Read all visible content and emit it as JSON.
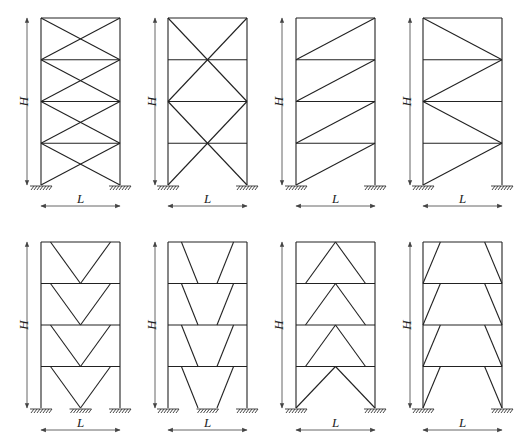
{
  "figure": {
    "labels": {
      "height": "H",
      "width": "L"
    },
    "stories": 4,
    "colors": {
      "line": "#222222",
      "dimension": "#555555",
      "background": "#ffffff"
    },
    "rows": [
      {
        "name": "top-row",
        "frame_top": 18,
        "frame_bottom": 185,
        "dim_y": 206,
        "panels": [
          {
            "id": "x-bracing-each-story",
            "x_left": 41,
            "x_right": 120,
            "h_arrow_x": 27,
            "type": "X"
          },
          {
            "id": "x-bracing-two-story",
            "x_left": 168,
            "x_right": 247,
            "h_arrow_x": 155,
            "type": "X2"
          },
          {
            "id": "single-diagonal-same-direction",
            "x_left": 296,
            "x_right": 375,
            "h_arrow_x": 282,
            "type": "D"
          },
          {
            "id": "single-diagonal-alternating",
            "x_left": 423,
            "x_right": 502,
            "h_arrow_x": 410,
            "type": "Z"
          }
        ]
      },
      {
        "name": "bottom-row",
        "frame_top": 242,
        "frame_bottom": 408,
        "dim_y": 430,
        "panels": [
          {
            "id": "v-bracing",
            "x_left": 41,
            "x_right": 120,
            "h_arrow_x": 27,
            "type": "V"
          },
          {
            "id": "v-bracing-eccentric",
            "x_left": 168,
            "x_right": 247,
            "h_arrow_x": 155,
            "type": "VE"
          },
          {
            "id": "inverted-v-chevron",
            "x_left": 296,
            "x_right": 375,
            "h_arrow_x": 282,
            "type": "A"
          },
          {
            "id": "inverted-v-eccentric-knee",
            "x_left": 423,
            "x_right": 502,
            "h_arrow_x": 410,
            "type": "AE"
          }
        ]
      }
    ],
    "caption": ""
  }
}
